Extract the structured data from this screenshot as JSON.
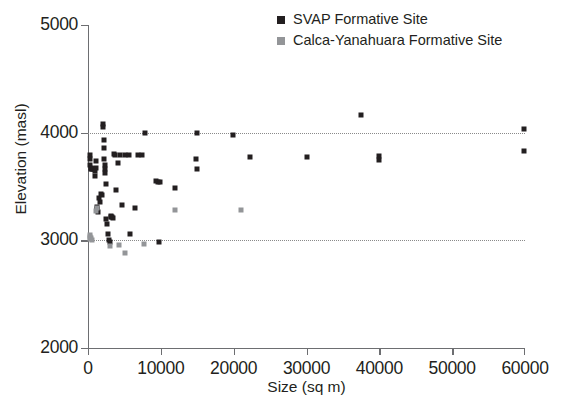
{
  "chart_data": {
    "type": "scatter",
    "title": "",
    "xlabel": "Size (sq m)",
    "ylabel": "Elevation (masl)",
    "xlim": [
      0,
      60000
    ],
    "ylim": [
      2000,
      5000
    ],
    "xticks": [
      0,
      10000,
      20000,
      30000,
      40000,
      50000,
      60000
    ],
    "yticks": [
      2000,
      3000,
      4000,
      5000
    ],
    "xticklabels": [
      "0",
      "10000",
      "20000",
      "30000",
      "40000",
      "50000",
      "60000"
    ],
    "yticklabels": [
      "2000",
      "3000",
      "4000",
      "5000"
    ],
    "grid": "horizontal-dotted-at-3000-and-4000",
    "gridlines_y": [
      3000,
      4000
    ],
    "legend_position": "top-right",
    "series": [
      {
        "name": "SVAP Formative Site",
        "color": "#231f20",
        "marker": "square",
        "points": [
          [
            300,
            3790
          ],
          [
            300,
            3755
          ],
          [
            320,
            3700
          ],
          [
            350,
            3670
          ],
          [
            420,
            3660
          ],
          [
            520,
            3665
          ],
          [
            700,
            3665
          ],
          [
            780,
            3665
          ],
          [
            900,
            3640
          ],
          [
            950,
            3595
          ],
          [
            1050,
            3740
          ],
          [
            1150,
            3670
          ],
          [
            1250,
            3305
          ],
          [
            1300,
            3290
          ],
          [
            1400,
            3260
          ],
          [
            1500,
            3390
          ],
          [
            1600,
            3355
          ],
          [
            1750,
            3430
          ],
          [
            1900,
            3420
          ],
          [
            2050,
            4085
          ],
          [
            2080,
            4055
          ],
          [
            2150,
            3930
          ],
          [
            2200,
            3860
          ],
          [
            2250,
            3760
          ],
          [
            2300,
            3700
          ],
          [
            2350,
            3665
          ],
          [
            2380,
            3625
          ],
          [
            2450,
            3520
          ],
          [
            2500,
            3200
          ],
          [
            2600,
            3150
          ],
          [
            2700,
            3060
          ],
          [
            2900,
            3000
          ],
          [
            3000,
            2985
          ],
          [
            3100,
            3230
          ],
          [
            3150,
            3215
          ],
          [
            3250,
            3220
          ],
          [
            3400,
            3205
          ],
          [
            3550,
            3800
          ],
          [
            3700,
            3790
          ],
          [
            3800,
            3470
          ],
          [
            4100,
            3720
          ],
          [
            4400,
            3790
          ],
          [
            4600,
            3330
          ],
          [
            5100,
            3790
          ],
          [
            5600,
            3790
          ],
          [
            5800,
            3060
          ],
          [
            6400,
            3300
          ],
          [
            6900,
            3790
          ],
          [
            7400,
            3790
          ],
          [
            7800,
            4000
          ],
          [
            9300,
            3550
          ],
          [
            9600,
            3545
          ],
          [
            9700,
            2980
          ],
          [
            9900,
            3540
          ],
          [
            11900,
            3490
          ],
          [
            14800,
            3760
          ],
          [
            14900,
            4000
          ],
          [
            15000,
            3660
          ],
          [
            19900,
            3975
          ],
          [
            22200,
            3770
          ],
          [
            30000,
            3770
          ],
          [
            37500,
            4160
          ],
          [
            39900,
            3780
          ],
          [
            40000,
            3745
          ],
          [
            59900,
            4030
          ],
          [
            59900,
            3830
          ]
        ]
      },
      {
        "name": "Calca-Yanahuara Formative Site",
        "color": "#939598",
        "marker": "square",
        "points": [
          [
            250,
            3050
          ],
          [
            280,
            3035
          ],
          [
            330,
            3010
          ],
          [
            400,
            3025
          ],
          [
            550,
            3000
          ],
          [
            1100,
            3270
          ],
          [
            1200,
            3300
          ],
          [
            3000,
            2945
          ],
          [
            4200,
            2960
          ],
          [
            5100,
            2880
          ],
          [
            7700,
            2965
          ],
          [
            12000,
            3280
          ],
          [
            21000,
            3285
          ]
        ]
      }
    ]
  },
  "legend": {
    "entries": [
      {
        "label": "SVAP Formative Site",
        "color": "#231f20"
      },
      {
        "label": "Calca-Yanahuara Formative Site",
        "color": "#939598"
      }
    ]
  },
  "axes": {
    "x_title": "Size (sq m)",
    "y_title": "Elevation (masl)"
  }
}
